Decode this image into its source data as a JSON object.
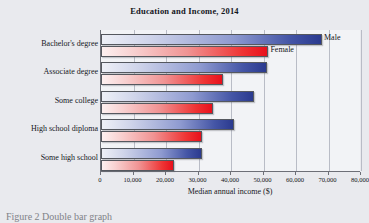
{
  "chart_data": {
    "type": "bar",
    "orientation": "horizontal",
    "title": "Education and Income, 2014",
    "xlabel": "Median annual income ($)",
    "ylabel": "",
    "categories": [
      "Bachelor's degree",
      "Associate degree",
      "Some college",
      "High school diploma",
      "Some high school"
    ],
    "series": [
      {
        "name": "Male",
        "color": "#2b3a8f",
        "values": [
          68000,
          51000,
          47000,
          41000,
          31000
        ]
      },
      {
        "name": "Female",
        "color": "#e8101c",
        "values": [
          51500,
          37500,
          34500,
          31000,
          22500
        ]
      }
    ],
    "xlim": [
      0,
      80000
    ],
    "xticks": [
      0,
      10000,
      20000,
      30000,
      40000,
      50000,
      60000,
      70000,
      80000
    ],
    "xticklabels": [
      "0",
      "10,000",
      "20,000",
      "30,000",
      "40,000",
      "50,000",
      "60,000",
      "70,000",
      "80,000"
    ],
    "grid": true,
    "legend_position": "inline-at-bar-ends"
  },
  "caption": "Figure 2  Double bar graph"
}
